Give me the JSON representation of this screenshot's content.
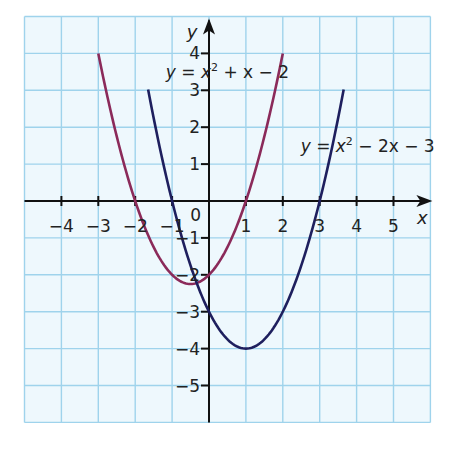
{
  "chart_data": {
    "type": "line",
    "title": "",
    "xlabel": "x",
    "ylabel": "y",
    "xlim": [
      -5,
      6
    ],
    "ylim": [
      -6,
      5
    ],
    "grid": true,
    "origin_label": "0",
    "x_ticks": [
      -4,
      -3,
      -2,
      -1,
      1,
      2,
      3,
      4,
      5
    ],
    "x_tick_labels": [
      "−4",
      "−3",
      "−2",
      "−1",
      "1",
      "2",
      "3",
      "4",
      "5"
    ],
    "y_ticks": [
      4,
      3,
      2,
      1,
      -1,
      -2,
      -3,
      -4,
      -5
    ],
    "y_tick_labels": [
      "4",
      "3",
      "2",
      "1",
      "−1",
      "−2",
      "−3",
      "−4",
      "−5"
    ],
    "series": [
      {
        "name": "y = x² + x − 2",
        "label_parts": {
          "a": "y",
          "eq": " = ",
          "b": "x",
          "sup": "2",
          "rest": " + x − 2"
        },
        "color": "#8b2a5a",
        "coeffs": [
          1,
          1,
          -2
        ],
        "x_range": [
          -3,
          2
        ],
        "x": [
          -3,
          -2.5,
          -2,
          -1.5,
          -1,
          -0.5,
          0,
          0.5,
          1,
          1.5,
          2
        ],
        "values": [
          4,
          1.75,
          0,
          -1.25,
          -2,
          -2.25,
          -2,
          -1.25,
          0,
          1.75,
          4
        ]
      },
      {
        "name": "y = x² − 2x − 3",
        "label_parts": {
          "a": "y",
          "eq": " = ",
          "b": "x",
          "sup": "2",
          "rest": " − 2x − 3"
        },
        "color": "#1e1f5e",
        "coeffs": [
          1,
          -2,
          -3
        ],
        "x_range": [
          -1.65,
          3.65
        ],
        "x": [
          -1.65,
          -1,
          -0.5,
          0,
          0.5,
          1,
          1.5,
          2,
          2.5,
          3,
          3.65
        ],
        "values": [
          4.02,
          0,
          -1.75,
          -3,
          -3.75,
          -4,
          -3.75,
          -3,
          -1.75,
          0,
          4.02
        ]
      }
    ],
    "annotations": [
      {
        "text": "y = x² + x − 2",
        "x": 0.5,
        "y": 3.5
      },
      {
        "text": "y = x² − 2x − 3",
        "x": 4.3,
        "y": 1.5
      }
    ],
    "colors": {
      "grid": "#9fd3ec",
      "axis": "#111111",
      "background": "#eef8fd"
    }
  }
}
